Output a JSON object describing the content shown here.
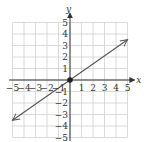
{
  "chart_data": {
    "type": "line",
    "title": "",
    "xlabel": "x",
    "ylabel": "y",
    "xlim": [
      -5,
      5
    ],
    "ylim": [
      -5,
      5
    ],
    "grid": true,
    "x_ticks": [
      -5,
      -4,
      -3,
      -2,
      -1,
      1,
      2,
      3,
      4,
      5
    ],
    "y_ticks": [
      -5,
      -4,
      -3,
      -2,
      -1,
      1,
      2,
      3,
      4,
      5
    ],
    "series": [
      {
        "name": "line through origin",
        "x": [
          -5,
          0,
          5
        ],
        "y": [
          -3.5,
          0,
          3.5
        ],
        "arrows": "both"
      }
    ],
    "points": [
      {
        "x": 0,
        "y": 0,
        "label": "origin"
      }
    ],
    "colors": {
      "line": "#555555",
      "grid": "#d0d0d0",
      "axis": "#333333",
      "point": "#222222"
    }
  },
  "labels": {
    "x_axis": "x",
    "y_axis": "y",
    "x_ticks": [
      "−5",
      "−4",
      "−3",
      "−2",
      "−1",
      "1",
      "2",
      "3",
      "4",
      "5"
    ],
    "y_ticks": [
      "5",
      "4",
      "3",
      "2",
      "1",
      "−1",
      "−2",
      "−3",
      "−4",
      "−5"
    ]
  }
}
